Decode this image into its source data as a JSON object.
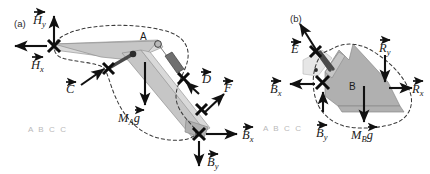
{
  "figure": {
    "background_color": "#ffffff"
  },
  "panels": [
    {
      "tag": "(a)",
      "tag_x": 14,
      "tag_y": 27,
      "body_point_label": "A",
      "watermark": "A B C C",
      "forces": [
        {
          "name": "Hy",
          "label_main": "H",
          "label_sub": "y"
        },
        {
          "name": "Hx",
          "label_main": "H",
          "label_sub": "x"
        },
        {
          "name": "C",
          "label_main": "C",
          "label_sub": ""
        },
        {
          "name": "D",
          "label_main": "D",
          "label_sub": ""
        },
        {
          "name": "F",
          "label_main": "F",
          "label_sub": ""
        },
        {
          "name": "Bx",
          "label_main": "B",
          "label_sub": "x"
        },
        {
          "name": "By",
          "label_main": "B",
          "label_sub": "y"
        },
        {
          "name": "weight",
          "label_main": "M",
          "label_sub": "A",
          "label_tail": "g"
        }
      ]
    },
    {
      "tag": "(b)",
      "tag_x": 290,
      "tag_y": 22,
      "body_point_label": "B",
      "watermark": "A B C C",
      "forces": [
        {
          "name": "E",
          "label_main": "E",
          "label_sub": ""
        },
        {
          "name": "Ry",
          "label_main": "R",
          "label_sub": "y"
        },
        {
          "name": "Rx",
          "label_main": "R",
          "label_sub": "x"
        },
        {
          "name": "Bx",
          "label_main": "B",
          "label_sub": "x"
        },
        {
          "name": "By",
          "label_main": "B",
          "label_sub": "y"
        },
        {
          "name": "weight",
          "label_main": "M",
          "label_sub": "B",
          "label_tail": "g"
        }
      ]
    }
  ],
  "labels": {
    "panel_a_tag": "(a)",
    "panel_b_tag": "(b)",
    "point_A": "A",
    "point_B": "B",
    "watermark_a": "A B C C",
    "watermark_b": "A B C C",
    "H_main": "H",
    "H_sub_y": "y",
    "H_sub_x": "x",
    "C_main": "C",
    "D_main": "D",
    "F_main": "F",
    "E_main": "E",
    "R_main": "R",
    "R_sub_y": "y",
    "R_sub_x": "x",
    "B_main": "B",
    "B_sub_x": "x",
    "B_sub_y": "y",
    "M_main": "M",
    "M_sub_A": "A",
    "M_sub_B": "B",
    "g_main": "g"
  },
  "colors": {
    "ink": "#111111",
    "dashed_cut": "#3a3a3a",
    "body_light": "#d9d9d9",
    "body_mid": "#c6c6c6",
    "body_dark": "#b0b0b0",
    "cylinder_barrel": "#6f6f6f",
    "watermark": "#b9b9b9"
  }
}
